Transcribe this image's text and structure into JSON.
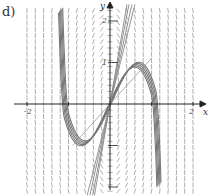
{
  "figure_label": "d)",
  "chart_data": {
    "type": "line",
    "title": "",
    "subtitle": "Direction field with solution curves",
    "xlabel": "x",
    "ylabel": "y",
    "xlim": [
      -2.4,
      2.4
    ],
    "ylim": [
      -2.2,
      2.4
    ],
    "x_ticks": [
      -2,
      -1,
      1,
      2
    ],
    "x_tick_labels": [
      "-2",
      "-1",
      "1",
      "2"
    ],
    "y_ticks": [
      -2,
      -1,
      1,
      2
    ],
    "y_tick_labels": [
      "-2",
      "-1",
      "1",
      "2"
    ],
    "shown_tick_labels": {
      "x": [
        "-2",
        "2"
      ],
      "y": [
        "2",
        "1"
      ]
    },
    "grid": false,
    "legend": null,
    "series": [
      {
        "name": "solution curves (cubic-like, through origin)",
        "style": "thick gray bundle",
        "points": [
          [
            -1.25,
            2.4
          ],
          [
            -1.2,
            0
          ],
          [
            -1.0,
            -1.3
          ],
          [
            -0.6,
            -1.2
          ],
          [
            0,
            0
          ],
          [
            0.6,
            1.2
          ],
          [
            1.0,
            1.4
          ],
          [
            1.15,
            0
          ],
          [
            1.2,
            -2.2
          ]
        ]
      },
      {
        "name": "near-linear solution curves through origin",
        "style": "thin gray lines",
        "points": [
          [
            -0.45,
            -2.2
          ],
          [
            0,
            0
          ],
          [
            0.45,
            2.4
          ]
        ]
      }
    ],
    "annotations": [
      "slope field line segments across grid"
    ]
  }
}
